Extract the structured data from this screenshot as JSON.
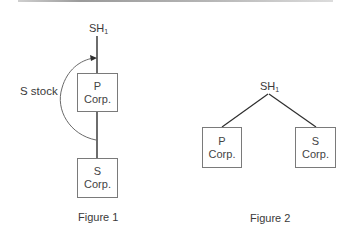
{
  "figure1": {
    "caption": "Figure 1",
    "top_label": {
      "main": "SH",
      "sub": "1"
    },
    "arrow_label": "S stock",
    "boxes": [
      {
        "line1": "P",
        "line2": "Corp."
      },
      {
        "line1": "S",
        "line2": "Corp."
      }
    ]
  },
  "figure2": {
    "caption": "Figure 2",
    "top_label": {
      "main": "SH",
      "sub": "1"
    },
    "boxes": [
      {
        "line1": "P",
        "line2": "Corp."
      },
      {
        "line1": "S",
        "line2": "Corp."
      }
    ]
  },
  "colors": {
    "line": "#2e2e2e",
    "box_border": "#7a7a7a",
    "text": "#3a3a3a"
  }
}
